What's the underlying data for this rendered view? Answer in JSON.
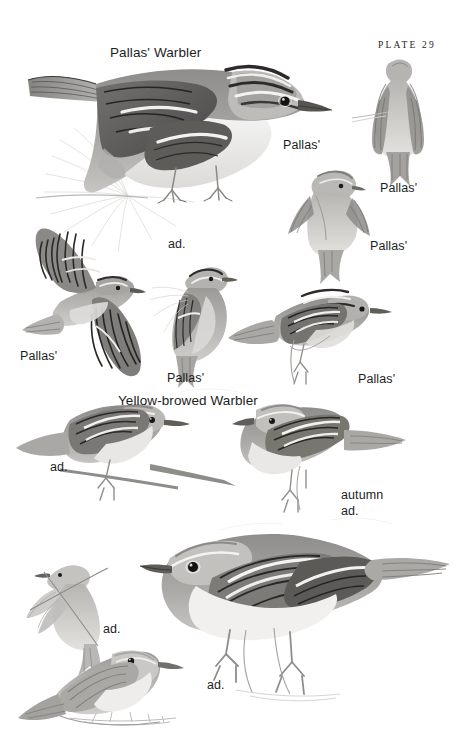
{
  "plate": {
    "number_label": "PLATE 29",
    "background_color": "#ffffff",
    "ink_color": "#1d1d1d",
    "medium": "grayscale watercolour / pencil bird plate"
  },
  "headings": [
    {
      "name": "pallas-warbler-heading",
      "text": "Pallas' Warbler",
      "x": 110,
      "y": 44
    },
    {
      "name": "yellow-browed-warbler-heading",
      "text": "Yellow-browed Warbler",
      "x": 118,
      "y": 392
    }
  ],
  "captions": [
    {
      "name": "caption-pallas-perched-main",
      "text": "Pallas'",
      "x": 283,
      "y": 137
    },
    {
      "name": "caption-pallas-underside",
      "text": "Pallas'",
      "x": 380,
      "y": 180
    },
    {
      "name": "caption-pallas-hover",
      "text": "Pallas'",
      "x": 370,
      "y": 238
    },
    {
      "name": "caption-ad-main",
      "text": "ad.",
      "x": 168,
      "y": 236
    },
    {
      "name": "caption-pallas-flight",
      "text": "Pallas'",
      "x": 20,
      "y": 348
    },
    {
      "name": "caption-pallas-clinging",
      "text": "Pallas'",
      "x": 167,
      "y": 370
    },
    {
      "name": "caption-pallas-lower-right",
      "text": "Pallas'",
      "x": 358,
      "y": 371
    },
    {
      "name": "caption-ad-yellow-browed-left",
      "text": "ad.",
      "x": 50,
      "y": 459
    },
    {
      "name": "caption-autumn",
      "text": "autumn",
      "x": 341,
      "y": 487
    },
    {
      "name": "caption-ad-autumn",
      "text": "ad.",
      "x": 341,
      "y": 503
    },
    {
      "name": "caption-ad-hover-lower",
      "text": "ad.",
      "x": 103,
      "y": 621
    },
    {
      "name": "caption-ad-large-lower",
      "text": "ad.",
      "x": 207,
      "y": 677
    }
  ],
  "figures": [
    {
      "name": "pallas-warbler-adult-perched",
      "species": "Pallas' Warbler",
      "pose": "adult perched on pine spray, side profile"
    },
    {
      "name": "pallas-warbler-underside",
      "species": "Pallas' Warbler",
      "pose": "hovering seen from below, rump patch"
    },
    {
      "name": "pallas-warbler-hovering",
      "species": "Pallas' Warbler",
      "pose": "hovering, viewed from behind"
    },
    {
      "name": "pallas-warbler-in-flight",
      "species": "Pallas' Warbler",
      "pose": "in flight, wings spread, upperside"
    },
    {
      "name": "pallas-warbler-clinging",
      "species": "Pallas' Warbler",
      "pose": "clinging to stem, head raised"
    },
    {
      "name": "pallas-warbler-perched-branch",
      "species": "Pallas' Warbler",
      "pose": "perched on thin twig, side profile"
    },
    {
      "name": "yellow-browed-warbler-adult-left",
      "species": "Yellow-browed Warbler",
      "pose": "adult perched, side profile"
    },
    {
      "name": "yellow-browed-warbler-autumn-adult",
      "species": "Yellow-browed Warbler",
      "pose": "autumn adult perched, side profile"
    },
    {
      "name": "yellow-browed-warbler-hovering",
      "species": "Yellow-browed Warbler",
      "pose": "hovering at twig, wings down"
    },
    {
      "name": "yellow-browed-warbler-ground",
      "species": "Yellow-browed Warbler",
      "pose": "adult on ground, front-facing body"
    },
    {
      "name": "yellow-browed-warbler-large-adult",
      "species": "Yellow-browed Warbler",
      "pose": "large adult perched, side profile"
    }
  ]
}
